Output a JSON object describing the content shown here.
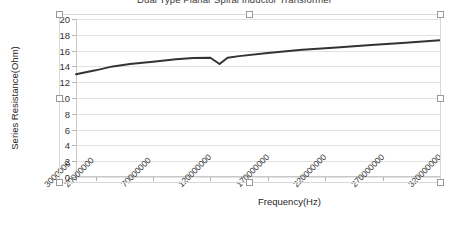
{
  "window": {
    "selected_object": "chart",
    "selection_handle_name": "resize-handle"
  },
  "chart_data": {
    "type": "line",
    "title": "Dual Type Planar Spiral Inductor Transformer",
    "xlabel": "Frequency(Hz)",
    "ylabel": "Series Resistance(Ohm)",
    "grid": true,
    "legend": "none",
    "xlim": [
      3000000,
      320000000
    ],
    "ylim": [
      0,
      20
    ],
    "ytick_labels": [
      "20",
      "18",
      "16",
      "14",
      "12",
      "10",
      "8",
      "6",
      "4",
      "2",
      "0"
    ],
    "ytick_values": [
      20,
      18,
      16,
      14,
      12,
      10,
      8,
      6,
      4,
      2,
      0
    ],
    "xtick_labels": [
      "3000000",
      "20000000",
      "70000000",
      "120000000",
      "170000000",
      "220000000",
      "270000000",
      "320000000"
    ],
    "xtick_values": [
      3000000,
      20000000,
      70000000,
      120000000,
      170000000,
      220000000,
      270000000,
      320000000
    ],
    "series": [
      {
        "name": "Series Resistance",
        "color": "#333333",
        "x": [
          3000000,
          20000000,
          35000000,
          50000000,
          70000000,
          90000000,
          105000000,
          120000000,
          128000000,
          135000000,
          145000000,
          170000000,
          200000000,
          230000000,
          260000000,
          290000000,
          320000000
        ],
        "values": [
          13.0,
          13.5,
          14.0,
          14.3,
          14.6,
          14.9,
          15.05,
          15.1,
          14.3,
          15.1,
          15.3,
          15.7,
          16.1,
          16.4,
          16.7,
          17.0,
          17.3
        ]
      }
    ]
  }
}
